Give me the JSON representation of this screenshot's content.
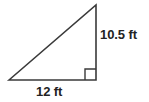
{
  "figure": {
    "kind": "right-triangle-diagram",
    "background_color": "#ffffff",
    "stroke_color": "#3a3a3a",
    "stroke_width": 1.6,
    "text_color": "#232323",
    "vertices": {
      "left": [
        9,
        80
      ],
      "apex": [
        96,
        5
      ],
      "right_angle": [
        96,
        80
      ]
    },
    "right_angle_marker": {
      "name": "right-angle-square",
      "size": 11,
      "corner": [
        96,
        80
      ]
    },
    "labels": {
      "vertical_leg": "10.5 ft",
      "horizontal_leg": "12 ft"
    }
  }
}
